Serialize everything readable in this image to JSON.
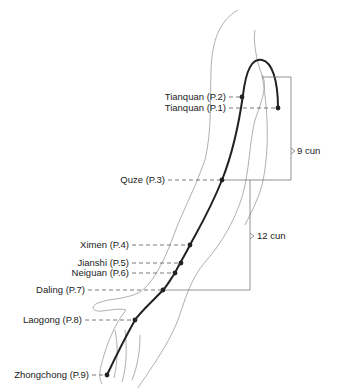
{
  "diagram": {
    "points": [
      {
        "label": "Tianquan (P.2)",
        "x": 242,
        "y": 97,
        "label_right": 226,
        "label_y": 92
      },
      {
        "label": "Tianquan (P.1)",
        "x": 278,
        "y": 108,
        "label_right": 226,
        "label_y": 103
      },
      {
        "label": "Quze (P.3)",
        "x": 222,
        "y": 180,
        "label_right": 165,
        "label_y": 175
      },
      {
        "label": "Ximen (P.4)",
        "x": 190,
        "y": 245,
        "label_right": 129,
        "label_y": 240
      },
      {
        "label": "Jianshi (P.5)",
        "x": 181,
        "y": 263,
        "label_right": 129,
        "label_y": 258
      },
      {
        "label": "Neiguan (P.6)",
        "x": 175,
        "y": 273,
        "label_right": 129,
        "label_y": 268
      },
      {
        "label": "Daling (P.7)",
        "x": 163,
        "y": 290,
        "label_right": 85,
        "label_y": 285
      },
      {
        "label": "Laogong (P.8)",
        "x": 135,
        "y": 320,
        "label_right": 82,
        "label_y": 315
      },
      {
        "label": "Zhongchong (P.9)",
        "x": 107,
        "y": 375,
        "label_right": 89,
        "label_y": 370
      }
    ],
    "measurements": [
      {
        "label": "9 cun",
        "x": 297,
        "y": 151
      },
      {
        "label": "12 cun",
        "x": 257,
        "y": 236
      }
    ],
    "colors": {
      "meridian": "#222222",
      "outline": "#8a8a8a",
      "guide": "#555555"
    }
  }
}
